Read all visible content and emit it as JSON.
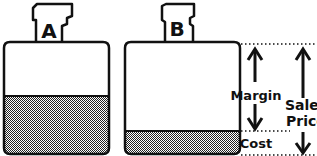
{
  "diagram": {
    "bottles": [
      {
        "label": "A",
        "fill_fraction": 0.45
      },
      {
        "label": "B",
        "fill_fraction": 0.18
      }
    ],
    "annotations": {
      "margin": "Margin",
      "cost": "Cost",
      "sales_price_line1": "Sales",
      "sales_price_line2": "Price"
    },
    "colors": {
      "outline": "#111111",
      "fill_pattern": "#333333",
      "background": "#ffffff"
    }
  }
}
